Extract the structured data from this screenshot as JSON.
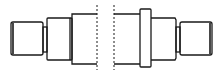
{
  "diagram": {
    "title": "Stepped shaft (broken view)",
    "colors": {
      "line": "#1a1a1a",
      "background": "#ffffff"
    },
    "left_part": {
      "end_stub": {
        "x": 11,
        "y": 22,
        "w": 32,
        "h": 33
      },
      "neck": {
        "x": 43,
        "y": 27,
        "w": 4,
        "h": 25
      },
      "step": {
        "x": 47,
        "y": 18,
        "w": 25,
        "h": 42
      },
      "body": {
        "x": 72,
        "y": 14,
        "w": 25,
        "h": 50
      }
    },
    "break_lines": [
      97,
      114
    ],
    "right_part": {
      "body": {
        "x": 114,
        "y": 14,
        "w": 26,
        "h": 50
      },
      "collar": {
        "x": 140,
        "y": 9,
        "w": 11,
        "h": 58
      },
      "step": {
        "x": 151,
        "y": 18,
        "w": 25,
        "h": 42
      },
      "neck": {
        "x": 176,
        "y": 27,
        "w": 4,
        "h": 25
      },
      "end_stub": {
        "x": 180,
        "y": 22,
        "w": 32,
        "h": 33
      }
    }
  }
}
